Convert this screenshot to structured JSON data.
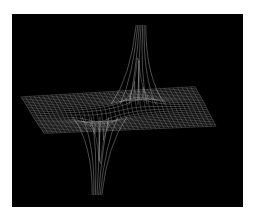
{
  "chart_data": {
    "type": "surface-wireframe",
    "title": "",
    "xlabel": "",
    "ylabel": "",
    "zlabel": "",
    "description": "3D wireframe mesh of a flat plane with one sharp upward spike (rear) and one sharp downward spike (front), resembling a dipole / 1/r potential pair",
    "grid": false,
    "legend": "none",
    "colors": {
      "background": "#000000",
      "mesh": "#9a9a9a",
      "mesh_highlight": "#d8d8d8",
      "page": "#ffffff"
    },
    "mesh": {
      "rows": 24,
      "cols": 40
    },
    "poles": [
      {
        "name": "positive-peak",
        "u": 0.62,
        "v": 0.42,
        "strength": 1,
        "screen_tip": [
          141,
          25
        ]
      },
      {
        "name": "negative-peak",
        "u": 0.38,
        "v": 0.58,
        "strength": -1,
        "screen_tip": [
          97,
          195
        ]
      }
    ],
    "plane_corners_screen": {
      "back_left": [
        21,
        97
      ],
      "back_right": [
        195,
        87
      ],
      "front_right": [
        216,
        126
      ],
      "front_left": [
        44,
        133
      ]
    }
  }
}
